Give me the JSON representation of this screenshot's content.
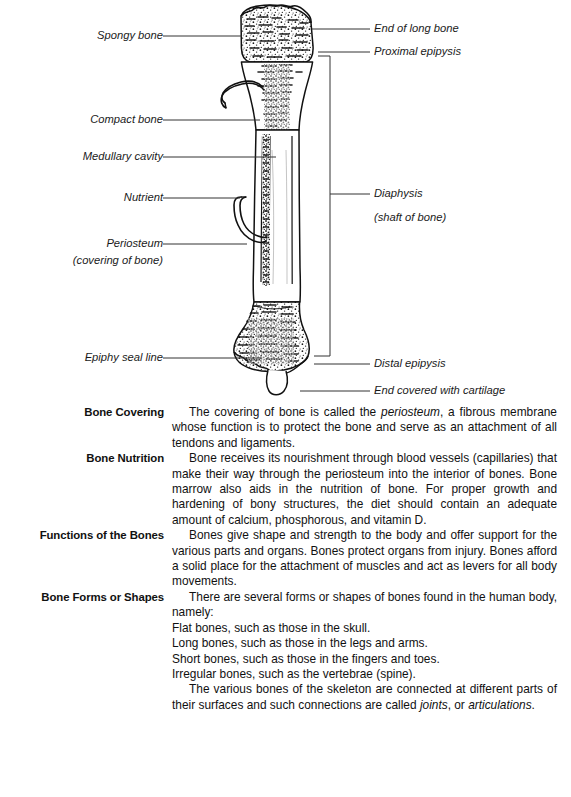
{
  "figure": {
    "name": "long-bone-cross-section",
    "labels_left": [
      {
        "id": "spongy-bone",
        "text": "Spongy bone",
        "x": 70,
        "y": 29,
        "w": 92,
        "leader_to_x": 228,
        "leader_y": 36
      },
      {
        "id": "compact-bone",
        "text": "Compact bone",
        "x": 58,
        "y": 113,
        "w": 104,
        "leader_to_x": 240,
        "leader_y": 120
      },
      {
        "id": "medullary-cavity",
        "text": "Medullary cavity",
        "x": 48,
        "y": 150,
        "w": 114,
        "leader_to_x": 258,
        "leader_y": 157
      },
      {
        "id": "nutrient",
        "text": "Nutrient",
        "x": 98,
        "y": 191,
        "w": 64,
        "leader_to_x": 240,
        "leader_y": 198
      },
      {
        "id": "periosteum",
        "text": "Periosteum",
        "x": 82,
        "y": 237,
        "w": 80,
        "leader_to_x": 245,
        "leader_y": 244
      },
      {
        "id": "periosteum-sub",
        "text": "(covering of bone)",
        "x": 46,
        "y": 254,
        "w": 116,
        "leader_to_x": null,
        "leader_y": null
      },
      {
        "id": "epiphy-seal-line",
        "text": "Epiphy seal line",
        "x": 57,
        "y": 351,
        "w": 105,
        "leader_to_x": 255,
        "leader_y": 358
      }
    ],
    "labels_right": [
      {
        "id": "end-of-long-bone",
        "text": "End of long bone",
        "x": 374,
        "y": 22,
        "leader_from_x": 318,
        "leader_y": 29
      },
      {
        "id": "proximal-epipysis",
        "text": "Proximal epipysis",
        "x": 374,
        "y": 45,
        "leader_from_x": 327,
        "leader_y": 52
      },
      {
        "id": "diaphysis",
        "text": "Diaphysis",
        "x": 374,
        "y": 187,
        "leader_from_x": 333,
        "leader_y": 194
      },
      {
        "id": "diaphysis-sub",
        "text": "(shaft of bone)",
        "x": 374,
        "y": 211,
        "leader_from_x": null,
        "leader_y": null
      },
      {
        "id": "distal-epipysis",
        "text": "Distal epipysis",
        "x": 374,
        "y": 357,
        "leader_from_x": 316,
        "leader_y": 364
      },
      {
        "id": "end-covered-cartilage",
        "text": "End covered with cartilage",
        "x": 374,
        "y": 384,
        "leader_from_x": 305,
        "leader_y": 391
      }
    ],
    "colors": {
      "ink": "#1a1a1a",
      "leader": "#303030",
      "bone_outline": "#111111",
      "paper": "#ffffff"
    }
  },
  "prose": {
    "sections": [
      {
        "id": "bone-covering",
        "heading": "Bone Covering",
        "paragraphs": [
          {
            "indent": true,
            "runs": [
              {
                "t": "The covering of bone is called the ",
                "i": false
              },
              {
                "t": "periosteum",
                "i": true
              },
              {
                "t": ", a fibrous membrane whose function is to protect the bone and serve as an attachment of all tendons and ligaments.",
                "i": false
              }
            ]
          }
        ]
      },
      {
        "id": "bone-nutrition",
        "heading": "Bone Nutrition",
        "paragraphs": [
          {
            "indent": true,
            "runs": [
              {
                "t": "Bone receives its nourishment through blood vessels (capillaries) that make their way through the periosteum into the interior of bones. Bone marrow also aids in the nutrition of bone. For proper growth and hardening of bony structures, the diet should contain an adequate amount of calcium, phosphorous, and vitamin D.",
                "i": false
              }
            ]
          }
        ]
      },
      {
        "id": "functions-of-the-bones",
        "heading": "Functions of the Bones",
        "paragraphs": [
          {
            "indent": true,
            "runs": [
              {
                "t": "Bones give shape and strength to the body and offer support for the various parts and organs. Bones protect organs from injury. Bones afford a solid place for the attachment of muscles and act as levers for all body movements.",
                "i": false
              }
            ]
          }
        ]
      },
      {
        "id": "bone-forms-or-shapes",
        "heading": "Bone Forms or Shapes",
        "paragraphs": [
          {
            "indent": true,
            "runs": [
              {
                "t": "There are several forms or shapes of bones found in the human body, namely:",
                "i": false
              }
            ]
          },
          {
            "indent": false,
            "runs": [
              {
                "t": "Flat bones, such as those in the skull.",
                "i": false
              }
            ]
          },
          {
            "indent": false,
            "runs": [
              {
                "t": "Long bones, such as those in the legs and arms.",
                "i": false
              }
            ]
          },
          {
            "indent": false,
            "runs": [
              {
                "t": "Short bones, such as those in the fingers and toes.",
                "i": false
              }
            ]
          },
          {
            "indent": false,
            "runs": [
              {
                "t": "Irregular bones, such as the vertebrae (spine).",
                "i": false
              }
            ]
          },
          {
            "indent": true,
            "runs": [
              {
                "t": "The various bones of the skeleton are connected at different parts of their surfaces and such connections are called ",
                "i": false
              },
              {
                "t": "joints",
                "i": true
              },
              {
                "t": ", or ",
                "i": false
              },
              {
                "t": "articulations",
                "i": true
              },
              {
                "t": ".",
                "i": false
              }
            ]
          }
        ]
      }
    ]
  }
}
